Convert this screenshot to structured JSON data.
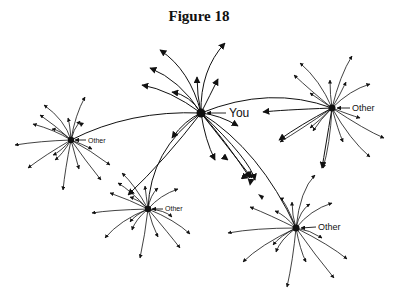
{
  "title": "Figure 18",
  "nodes": [
    {
      "id": "you",
      "label": "You",
      "x": 201,
      "y": 113,
      "label_size": 12
    },
    {
      "id": "other_left",
      "label": "Other",
      "x": 71,
      "y": 140,
      "label_size": 7
    },
    {
      "id": "other_right",
      "label": "Other",
      "x": 332,
      "y": 108,
      "label_size": 9
    },
    {
      "id": "other_bottom_left",
      "label": "Other",
      "x": 148,
      "y": 209,
      "label_size": 7
    },
    {
      "id": "other_bottom_right",
      "label": "Other",
      "x": 296,
      "y": 228,
      "label_size": 9
    }
  ],
  "connections": [
    {
      "from": "you",
      "to": "other_left"
    },
    {
      "from": "you",
      "to": "other_right"
    },
    {
      "from": "you",
      "to": "other_bottom_left"
    },
    {
      "from": "you",
      "to": "other_bottom_right"
    }
  ],
  "colors": {
    "line": "#111111",
    "background": "#ffffff"
  }
}
